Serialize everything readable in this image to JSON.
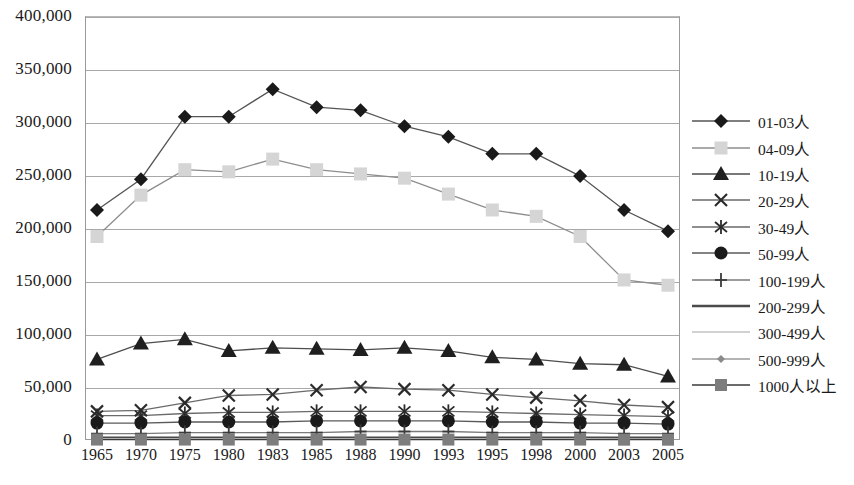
{
  "chart_data": {
    "type": "line",
    "title": "",
    "subtitle": "",
    "xlabel": "",
    "ylabel": "",
    "grid": true,
    "legend_position": "right",
    "ylim": [
      0,
      400000
    ],
    "ytick_values": [
      0,
      50000,
      100000,
      150000,
      200000,
      250000,
      300000,
      350000,
      400000
    ],
    "ytick_labels": [
      "0",
      "50,000",
      "100,000",
      "150,000",
      "200,000",
      "250,000",
      "300,000",
      "350,000",
      "400,000"
    ],
    "categories": [
      "1965",
      "1970",
      "1975",
      "1980",
      "1983",
      "1985",
      "1988",
      "1990",
      "1993",
      "1995",
      "1998",
      "2000",
      "2003",
      "2005"
    ],
    "series": [
      {
        "name": "01-03人",
        "marker": "diamond",
        "color": "#1a1a1a",
        "line_color": "#555555",
        "values": [
          217000,
          246000,
          305000,
          305000,
          331000,
          314000,
          311000,
          296000,
          286000,
          270000,
          270000,
          249000,
          217000,
          197000
        ]
      },
      {
        "name": "04-09人",
        "marker": "square",
        "color": "#d5d5d5",
        "line_color": "#8d8d8d",
        "values": [
          192000,
          231000,
          255000,
          253000,
          265000,
          255000,
          251000,
          247000,
          232000,
          217000,
          211000,
          192000,
          151000,
          146000
        ]
      },
      {
        "name": "10-19人",
        "marker": "triangle",
        "color": "#1f1f1f",
        "line_color": "#4d4d4d",
        "values": [
          76000,
          91000,
          95000,
          84000,
          87000,
          86000,
          85000,
          87000,
          84000,
          78000,
          76000,
          72000,
          71000,
          60000
        ]
      },
      {
        "name": "20-29人",
        "marker": "x",
        "color": "#2b2b2b",
        "line_color": "#6a6a6a",
        "values": [
          27000,
          28000,
          35000,
          42000,
          43000,
          47000,
          50000,
          48000,
          47000,
          43000,
          40000,
          37000,
          33000,
          31000
        ]
      },
      {
        "name": "30-49人",
        "marker": "asterisk",
        "color": "#2b2b2b",
        "line_color": "#6a6a6a",
        "values": [
          23000,
          23000,
          25000,
          26000,
          26000,
          27000,
          27000,
          27000,
          27000,
          26000,
          25000,
          24000,
          23000,
          22000
        ]
      },
      {
        "name": "50-99人",
        "marker": "circle",
        "color": "#1a1a1a",
        "line_color": "#5a5a5a",
        "values": [
          16000,
          16000,
          17000,
          17000,
          17000,
          18000,
          18000,
          18000,
          18000,
          17000,
          17000,
          16000,
          16000,
          15000
        ]
      },
      {
        "name": "100-199人",
        "marker": "plus",
        "color": "#3a3a3a",
        "line_color": "#7a7a7a",
        "values": [
          6000,
          6000,
          7000,
          7000,
          7000,
          7000,
          8000,
          8000,
          8000,
          7000,
          7000,
          7000,
          6000,
          6000
        ]
      },
      {
        "name": "200-299人",
        "marker": "none",
        "color": "#4a4a4a",
        "line_color": "#4a4a4a",
        "values": [
          2000,
          2000,
          2000,
          2000,
          2000,
          2000,
          2000,
          2000,
          2000,
          2000,
          2000,
          2000,
          2000,
          2000
        ]
      },
      {
        "name": "300-499人",
        "marker": "none",
        "color": "#c3c3c3",
        "line_color": "#c3c3c3",
        "values": [
          1200,
          1200,
          1300,
          1300,
          1300,
          1300,
          1300,
          1300,
          1300,
          1200,
          1200,
          1200,
          1100,
          1100
        ]
      },
      {
        "name": "500-999人",
        "marker": "small-diamond",
        "color": "#8a8a8a",
        "line_color": "#9a9a9a",
        "values": [
          700,
          700,
          800,
          800,
          800,
          800,
          800,
          800,
          800,
          700,
          700,
          700,
          600,
          600
        ]
      },
      {
        "name": "1000人以上",
        "marker": "filled-square",
        "color": "#7d7d7d",
        "line_color": "#3a3a3a",
        "values": [
          400,
          400,
          400,
          400,
          400,
          400,
          400,
          400,
          400,
          400,
          400,
          400,
          300,
          300
        ]
      }
    ]
  },
  "legend": {
    "items": [
      {
        "label": "01-03人"
      },
      {
        "label": "04-09人"
      },
      {
        "label": "10-19人"
      },
      {
        "label": "20-29人"
      },
      {
        "label": "30-49人"
      },
      {
        "label": "50-99人"
      },
      {
        "label": "100-199人"
      },
      {
        "label": "200-299人"
      },
      {
        "label": "300-499人"
      },
      {
        "label": "500-999人"
      },
      {
        "label": "1000人以上"
      }
    ]
  }
}
